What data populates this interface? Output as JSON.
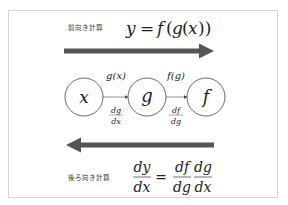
{
  "forward": {
    "label": "前向き計算",
    "formula": {
      "lhs": "y",
      "eq": "=",
      "rhs_f": "f",
      "rhs_open1": "(",
      "rhs_g": "g",
      "rhs_open2": "(",
      "rhs_x": "x",
      "rhs_close": "))"
    },
    "arrow_direction": "right",
    "arrow_color": "#555555"
  },
  "graph": {
    "nodes": [
      {
        "id": "x",
        "label": "x"
      },
      {
        "id": "g",
        "label": "g"
      },
      {
        "id": "f",
        "label": "f"
      }
    ],
    "edges": [
      {
        "from": "x",
        "to": "g",
        "forward_label": "g(x)",
        "backward_num": "dg",
        "backward_den": "dx"
      },
      {
        "from": "g",
        "to": "f",
        "forward_label": "f(g)",
        "backward_num": "df",
        "backward_den": "dg"
      }
    ]
  },
  "backward": {
    "label": "後ろ向き計算",
    "formula": {
      "lhs_num": "dy",
      "lhs_den": "dx",
      "eq": "=",
      "r1_num": "df",
      "r1_den": "dg",
      "r2_num": "dg",
      "r2_den": "dx"
    },
    "arrow_direction": "left",
    "arrow_color": "#555555"
  }
}
